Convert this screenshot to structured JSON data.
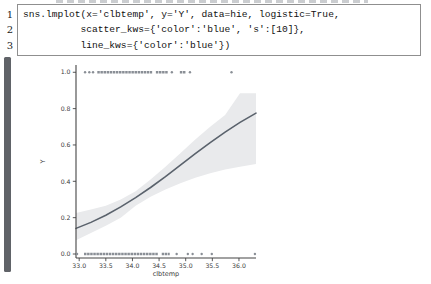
{
  "code": {
    "line_numbers": [
      "1",
      "2",
      "3"
    ],
    "lines": [
      "sns.lmplot(x='clbtemp', y='Y', data=hie, logistic=True,",
      "          scatter_kws={'color':'blue', 's':[10]},",
      "          line_kws={'color':'blue'})"
    ]
  },
  "chart_data": {
    "type": "scatter",
    "subtype": "seaborn lmplot with logistic regression fit and confidence band",
    "title": "",
    "xlabel": "clbtemp",
    "ylabel": "Y",
    "x_ticks": [
      33.0,
      33.5,
      34.0,
      34.5,
      35.0,
      35.5,
      36.0
    ],
    "y_ticks": [
      0.0,
      0.2,
      0.4,
      0.6,
      0.8,
      1.0
    ],
    "xlim": [
      32.94,
      36.32
    ],
    "ylim": [
      -0.022,
      1.04
    ],
    "grid": false,
    "legend": false,
    "logistic_fit": {
      "k": 0.9,
      "x0": 34.95
    },
    "scatter": {
      "y1": {
        "y": 1.0,
        "segments": [
          [
            33.34,
            34.37
          ],
          [
            34.44,
            34.67
          ],
          [
            34.89,
            35.0
          ]
        ],
        "points": [
          33.11,
          33.19,
          33.26,
          34.74,
          35.08,
          35.86
        ]
      },
      "y0": {
        "y": 0.0,
        "segments": [
          [
            33.09,
            34.48
          ],
          [
            34.55,
            34.7
          ]
        ],
        "points": [
          32.96,
          34.83,
          35.04,
          35.13,
          35.3,
          35.49,
          36.3
        ]
      }
    },
    "regression_curve": {
      "x": [
        32.94,
        33.22,
        33.5,
        33.78,
        34.06,
        34.34,
        34.62,
        34.9,
        35.18,
        35.46,
        35.74,
        36.02,
        36.32
      ],
      "y": [
        0.141,
        0.174,
        0.213,
        0.259,
        0.31,
        0.366,
        0.426,
        0.489,
        0.552,
        0.613,
        0.671,
        0.724,
        0.775
      ]
    },
    "confidence_band": {
      "x": [
        32.94,
        33.22,
        33.5,
        33.78,
        34.06,
        34.34,
        34.62,
        34.9,
        35.18,
        35.46,
        35.74,
        36.02,
        36.32
      ],
      "lo": [
        0.075,
        0.115,
        0.155,
        0.2,
        0.265,
        0.315,
        0.355,
        0.39,
        0.42,
        0.445,
        0.465,
        0.48,
        0.495
      ],
      "hi": [
        0.225,
        0.245,
        0.265,
        0.3,
        0.345,
        0.41,
        0.48,
        0.555,
        0.63,
        0.7,
        0.765,
        0.885,
        0.885
      ]
    },
    "colors": {
      "scatter": "#8a8f96",
      "line": "#5a626c",
      "band": "#e9eaec",
      "axis": "#444444",
      "tick_label": "#3a3a3a"
    }
  }
}
